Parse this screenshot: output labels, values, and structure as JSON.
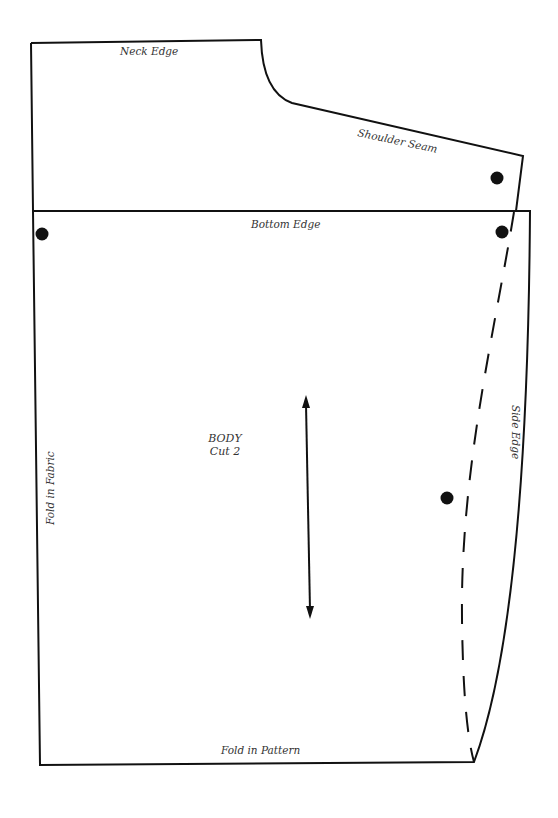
{
  "diagram": {
    "type": "sewing-pattern-piece",
    "colors": {
      "line": "#111111",
      "text": "#333333",
      "background": "#ffffff"
    },
    "labels": {
      "neck_edge": "Neck Edge",
      "shoulder_seam": "Shoulder Seam",
      "bottom_edge": "Bottom Edge",
      "side_edge": "Side Edge",
      "fold_in_fabric": "Fold in Fabric",
      "fold_in_pattern": "Fold in Pattern",
      "piece_name": "BODY",
      "cut_instruction": "Cut 2"
    },
    "markers": {
      "dots": [
        {
          "id": "shoulder-dot",
          "x": 497,
          "y": 178
        },
        {
          "id": "bottom-left-dot",
          "x": 42,
          "y": 234
        },
        {
          "id": "bottom-right-dot",
          "x": 502,
          "y": 232
        },
        {
          "id": "side-dot",
          "x": 447,
          "y": 498
        }
      ],
      "grainline": {
        "icon": "double-arrow",
        "from": [
          306,
          396
        ],
        "to": [
          310,
          618
        ]
      },
      "cutting_line": {
        "style": "dashed"
      }
    }
  }
}
